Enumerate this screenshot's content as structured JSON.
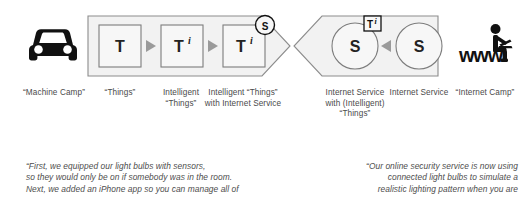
{
  "diagram": {
    "title_present": false,
    "left_band": {
      "name": "machine-camp-band",
      "shape": "right-pointing-pentagon",
      "fill": "#f2f2f2",
      "stroke": "#8c8c8c",
      "nodes": [
        {
          "id": "node-t",
          "label": "T",
          "superscript": "",
          "badge": null,
          "shape": "square"
        },
        {
          "id": "node-ti",
          "label": "T",
          "superscript": "i",
          "badge": null,
          "shape": "square"
        },
        {
          "id": "node-ti-s",
          "label": "T",
          "superscript": "i",
          "badge": "S",
          "shape": "square"
        }
      ],
      "connector": "triangle-right"
    },
    "right_band": {
      "name": "internet-camp-band",
      "shape": "left-pointing-pentagon",
      "fill": "#f2f2f2",
      "stroke": "#8c8c8c",
      "nodes": [
        {
          "id": "node-s-ti",
          "label": "S",
          "badge": "T",
          "badge_superscript": "i",
          "shape": "circle"
        },
        {
          "id": "node-s",
          "label": "S",
          "badge": null,
          "shape": "circle"
        }
      ],
      "connector": "triangle-left"
    },
    "icons": {
      "left": {
        "name": "car-icon",
        "label_key": "machine_camp"
      },
      "right": {
        "name": "www-person-laptop-icon",
        "text": "www"
      }
    },
    "labels": [
      {
        "id": "label-machine-camp",
        "lines": [
          "“Machine",
          "Camp”"
        ]
      },
      {
        "id": "label-things",
        "lines": [
          "“Things”"
        ]
      },
      {
        "id": "label-intelligent-things",
        "lines": [
          "Intelligent",
          "“Things”"
        ]
      },
      {
        "id": "label-intelligent-things-internet-service",
        "lines": [
          "Intelligent",
          "“Things” with",
          "Internet Service"
        ]
      },
      {
        "id": "label-internet-service-with-things",
        "lines": [
          "Internet",
          "Service with",
          "(Intelligent)",
          "“Things”"
        ]
      },
      {
        "id": "label-internet-service",
        "lines": [
          "Internet",
          "Service"
        ]
      },
      {
        "id": "label-internet-camp",
        "lines": [
          "“Internet",
          "Camp”"
        ]
      }
    ]
  },
  "quotes": {
    "left": {
      "arrow": "dotted-arrow-right",
      "lines": [
        "“First, we equipped our light bulbs with sensors,",
        "so they would only be on if somebody was in the room.",
        "Next, we added an iPhone app so you can manage all of"
      ]
    },
    "right": {
      "arrow": "dotted-arrow-left",
      "lines": [
        "“Our online security service is now using",
        "connected light bulbs to simulate a",
        "realistic lighting pattern when you are"
      ]
    }
  },
  "colors": {
    "band_fill": "#f2f2f2",
    "band_stroke": "#8c8c8c",
    "node_fill": "#f7f7f7",
    "node_stroke": "#7d7d7d",
    "text": "#3a3a3a",
    "label_text": "#4a4a4a",
    "icon_black": "#111111",
    "dotted": "#cfcfcf"
  }
}
